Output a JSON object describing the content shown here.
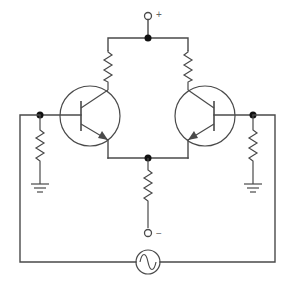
{
  "diagram": {
    "terminals": {
      "positive_label": "+",
      "negative_label": "−"
    },
    "components": [
      {
        "id": "R_C1",
        "type": "resistor",
        "role": "left collector resistor"
      },
      {
        "id": "R_C2",
        "type": "resistor",
        "role": "right collector resistor"
      },
      {
        "id": "Q1",
        "type": "npn-transistor",
        "role": "left transistor"
      },
      {
        "id": "Q2",
        "type": "npn-transistor",
        "role": "right transistor"
      },
      {
        "id": "R_B1",
        "type": "resistor",
        "role": "left base resistor to ground"
      },
      {
        "id": "R_B2",
        "type": "resistor",
        "role": "right base resistor to ground"
      },
      {
        "id": "R_E",
        "type": "resistor",
        "role": "common emitter resistor"
      },
      {
        "id": "V_AC",
        "type": "ac-source",
        "role": "input signal source"
      },
      {
        "id": "GND1",
        "type": "ground"
      },
      {
        "id": "GND2",
        "type": "ground"
      }
    ],
    "colors": {
      "line": "#4a4a4a",
      "junction": "#111111",
      "background": "#ffffff"
    }
  }
}
